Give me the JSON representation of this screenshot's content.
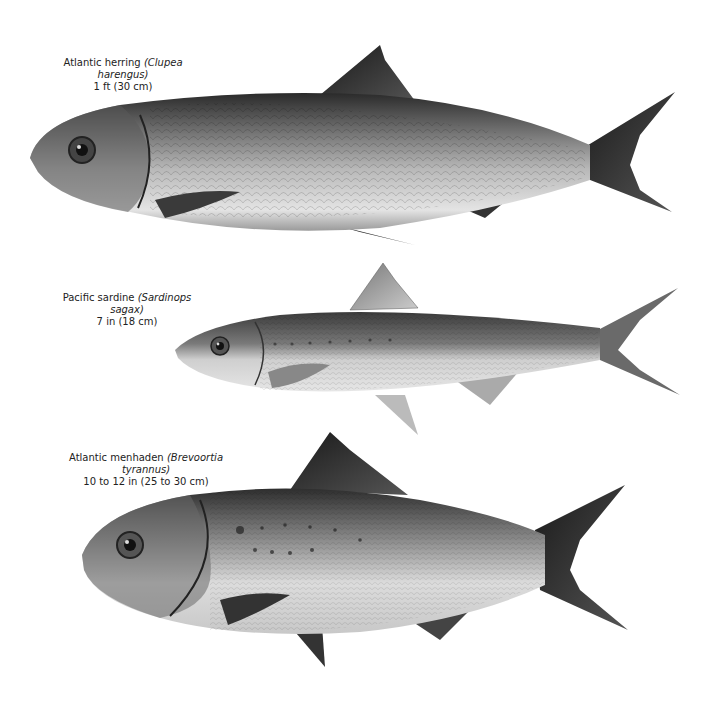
{
  "plate": {
    "fish": [
      {
        "common_name": "Atlantic herring",
        "scientific_name": "(Clupea harengus)",
        "size": "1 ft (30 cm)"
      },
      {
        "common_name": "Pacific sardine",
        "scientific_name": "(Sardinops sagax)",
        "size": "7 in (18 cm)"
      },
      {
        "common_name": "Atlantic menhaden",
        "scientific_name": "(Brevoortia tyrannus)",
        "size": "10 to 12 in (25 to 30 cm)"
      }
    ]
  }
}
